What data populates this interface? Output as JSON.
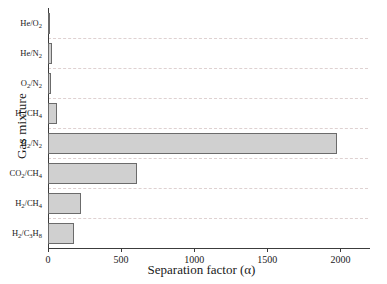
{
  "chart_data": {
    "type": "bar",
    "orientation": "horizontal",
    "title": "",
    "xlabel": "Separation factor (α)",
    "ylabel": "Gas mixture",
    "categories": [
      "He/O₂",
      "He/N₂",
      "O₂/N₂",
      "H₂/CH₄",
      "H₂/N₂",
      "CO₂/CH₄",
      "H₂/CH₄",
      "H₂/C₃H₈"
    ],
    "values": [
      12,
      25,
      18,
      60,
      1980,
      612,
      228,
      176
    ],
    "xlim": [
      0,
      2100
    ],
    "xticks": [
      0,
      500,
      1000,
      1500,
      2000
    ],
    "xticklabels": [
      "0",
      "500",
      "1000",
      "1500",
      "2000"
    ],
    "grid": true,
    "grid_axis": "y",
    "legend": null,
    "bar_fill_color": "#d0d0d0",
    "bar_edge_color": "#6b6b6b",
    "grid_color": "#d9c9c9",
    "axis_color": "#3c3c3c"
  },
  "category_labels_html": [
    "He/O<sub>2</sub>",
    "He/N<sub>2</sub>",
    "O<sub>2</sub>/N<sub>2</sub>",
    "H<sub>2</sub>/CH<sub>4</sub>",
    "H<sub>2</sub>/N<sub>2</sub>",
    "CO<sub>2</sub>/CH<sub>4</sub>",
    "H<sub>2</sub>/CH<sub>4</sub>",
    "H<sub>2</sub>/C<sub>3</sub>H<sub>8</sub>"
  ]
}
